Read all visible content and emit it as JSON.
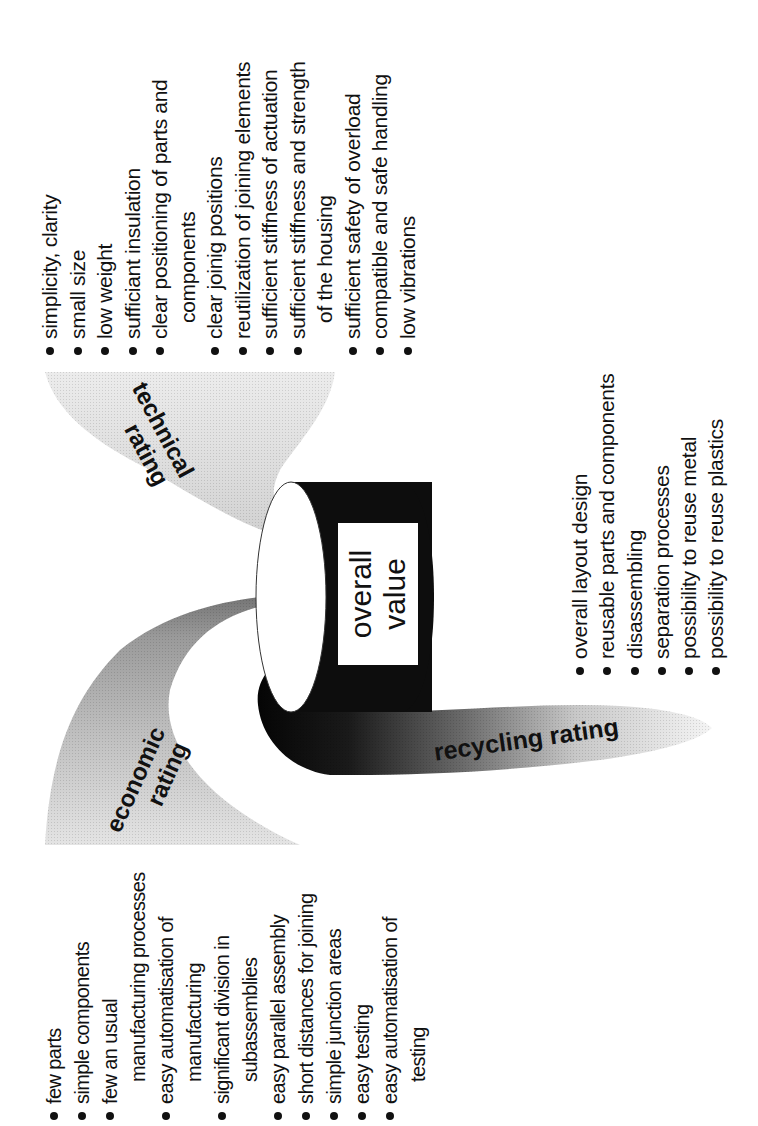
{
  "diagram": {
    "center": {
      "line1": "overall",
      "line2": "value"
    },
    "arrows": {
      "technical": {
        "line1": "technical",
        "line2": "rating"
      },
      "economic": {
        "line1": "economic",
        "line2": "rating"
      },
      "recycling": {
        "label": "recycling rating"
      }
    },
    "technical_criteria": [
      {
        "text": "simplicity,  clarity",
        "bullet": true
      },
      {
        "text": "small size",
        "bullet": true
      },
      {
        "text": "low weight",
        "bullet": true
      },
      {
        "text": "sufficiant insulation",
        "bullet": true
      },
      {
        "text": "clear positioning of parts and",
        "bullet": true
      },
      {
        "text": "components",
        "bullet": false
      },
      {
        "text": "clear joinig positions",
        "bullet": true
      },
      {
        "text": "reutilization of joining elements",
        "bullet": true
      },
      {
        "text": "sufficient stiffness of actuation",
        "bullet": true
      },
      {
        "text": "sufficient stiffness and strength",
        "bullet": true
      },
      {
        "text": "of the housing",
        "bullet": false
      },
      {
        "text": "sufficient safety of overload",
        "bullet": true
      },
      {
        "text": "compatible and safe handling",
        "bullet": true
      },
      {
        "text": "low vibrations",
        "bullet": true
      }
    ],
    "recycling_criteria": [
      {
        "text": "overall layout design",
        "bullet": true
      },
      {
        "text": "reusable parts and components",
        "bullet": true
      },
      {
        "text": "disassembling",
        "bullet": true
      },
      {
        "text": "separation processes",
        "bullet": true
      },
      {
        "text": "possibility to reuse metal",
        "bullet": true
      },
      {
        "text": "possibility to reuse plastics",
        "bullet": true
      }
    ],
    "economic_criteria": [
      {
        "text": "few parts",
        "bullet": true
      },
      {
        "text": "simple components",
        "bullet": true
      },
      {
        "text": "few an usual",
        "bullet": true
      },
      {
        "text": "manufacturing processes",
        "bullet": false
      },
      {
        "text": "easy automatisation of",
        "bullet": true
      },
      {
        "text": "manufacturing",
        "bullet": false
      },
      {
        "text": "significant division in",
        "bullet": true
      },
      {
        "text": "subassemblies",
        "bullet": false
      },
      {
        "text": "easy parallel assembly",
        "bullet": true
      },
      {
        "text": "short distances for joining",
        "bullet": true
      },
      {
        "text": "simple junction areas",
        "bullet": true
      },
      {
        "text": "easy testing",
        "bullet": true
      },
      {
        "text": "easy automatisation of",
        "bullet": true
      },
      {
        "text": "testing",
        "bullet": false
      }
    ],
    "colors": {
      "ink": "#111111",
      "cylinder": "#0d0d0d",
      "technical_arrow": "#d9d9d9",
      "economic_arrow_light": "#e0e0e0",
      "economic_arrow_dark": "#6f6f6f",
      "recycling_arrow_dark": "#0a0a0a",
      "recycling_arrow_light": "#e8e8e8"
    }
  }
}
